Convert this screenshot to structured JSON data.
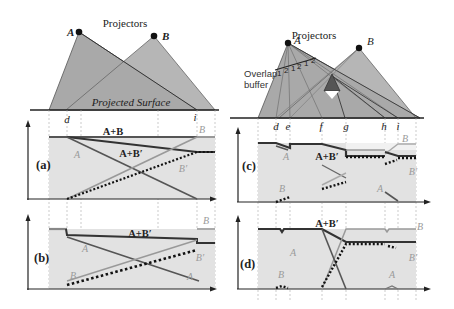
{
  "left": {
    "title": "Projectors",
    "projector_a": "A",
    "projector_b": "B",
    "surface_label": "Projected Surface",
    "marks": {
      "d": "d",
      "i": "i"
    },
    "panel_a": {
      "tag": "(a)",
      "sum_ab": "A+B",
      "sum_abp": "A+B′",
      "a": "A",
      "b": "B",
      "bp": "B′"
    },
    "panel_b": {
      "tag": "(b)",
      "sum_abp": "A+B′",
      "a1": "A",
      "a2": "A",
      "b1": "B",
      "b2": "B",
      "bp": "B′"
    }
  },
  "right": {
    "title": "Projectors",
    "projector_a": "A",
    "projector_b": "B",
    "overlap_label_1": "Overlap",
    "overlap_label_2": "buffer",
    "buffer_digits": [
      "1",
      "2",
      "1",
      "2",
      "1",
      "2"
    ],
    "marks": {
      "d": "d",
      "e": "e",
      "f": "f",
      "g": "g",
      "h": "h",
      "i": "i"
    },
    "panel_c": {
      "tag": "(c)",
      "sum_abp": "A+B′",
      "a1": "A",
      "a2": "A",
      "b1": "B",
      "b2": "B",
      "bp": "B′"
    },
    "panel_d": {
      "tag": "(d)",
      "sum_abp": "A+B′",
      "a1": "A",
      "a2": "A",
      "b1": "B",
      "b2": "B",
      "bp": "B′"
    }
  },
  "colors": {
    "projector_fill": "#a9a9a9",
    "panel_fill": "#e2e2e2",
    "line_dark": "#444444",
    "line_mid": "#7a7a7a",
    "line_light": "#a8a8a8",
    "dotted": "#111111"
  }
}
